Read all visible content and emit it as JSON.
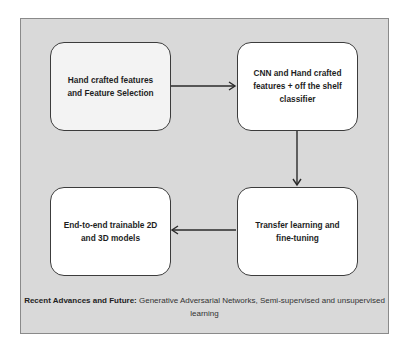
{
  "diagram": {
    "nodes": [
      {
        "id": "n1",
        "label": "Hand crafted features\nand Feature Selection",
        "fill": "#f3f3f3"
      },
      {
        "id": "n2",
        "label": "CNN and Hand crafted\nfeatures + off the shelf\nclassifier",
        "fill": "#ffffff"
      },
      {
        "id": "n3",
        "label": "Transfer learning and\nfine-tuning",
        "fill": "#ffffff"
      },
      {
        "id": "n4",
        "label": "End-to-end trainable 2D\nand 3D models",
        "fill": "#ffffff"
      }
    ],
    "edges": [
      {
        "from": "n1",
        "to": "n2",
        "direction": "right"
      },
      {
        "from": "n2",
        "to": "n3",
        "direction": "down"
      },
      {
        "from": "n3",
        "to": "n4",
        "direction": "left"
      }
    ],
    "caption": {
      "bold": "Recent Advances and Future:",
      "text": " Generative Adversarial Networks, Semi-supervised and unsupervised learning"
    },
    "colors": {
      "panel_background": "#d9d9d9",
      "panel_border": "#8a8a8a",
      "node_border": "#3c3c3c",
      "arrow": "#2a2a2a"
    }
  }
}
